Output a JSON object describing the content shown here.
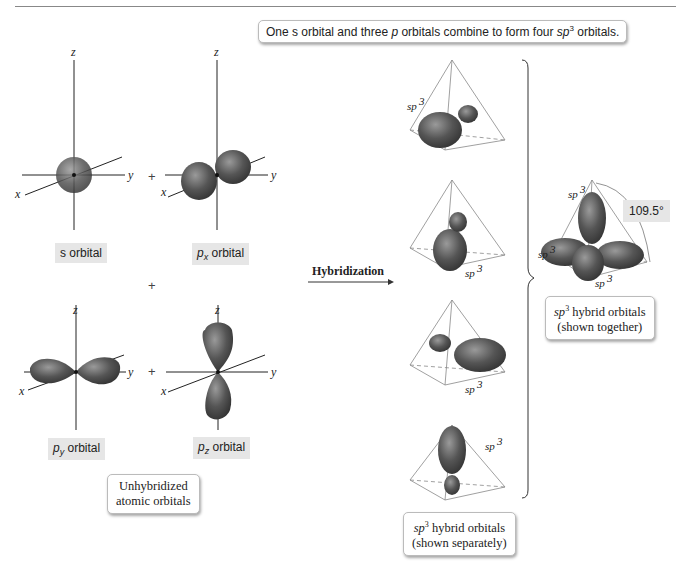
{
  "header": {
    "caption_prefix": "One s orbital and three ",
    "caption_p": "p",
    "caption_mid": " orbitals combine to form four ",
    "caption_sp": "sp",
    "caption_sup": "3",
    "caption_suffix": " orbitals."
  },
  "axes": {
    "x": "x",
    "y": "y",
    "z": "z"
  },
  "operators": {
    "plus": "+"
  },
  "orbitals": {
    "s": {
      "label": "s orbital"
    },
    "px": {
      "p": "p",
      "sub": "x",
      "label": " orbital"
    },
    "py": {
      "p": "p",
      "sub": "y",
      "label": " orbital"
    },
    "pz": {
      "p": "p",
      "sub": "z",
      "label": " orbital"
    }
  },
  "unhybridized_box": {
    "line1": "Unhybridized",
    "line2": "atomic orbitals"
  },
  "arrow": {
    "label": "Hybridization"
  },
  "sp3_label": "sp3",
  "separate_box": {
    "sp": "sp",
    "sup": "3",
    "line1_rest": " hybrid orbitals",
    "line2": "(shown separately)"
  },
  "together_box": {
    "sp": "sp",
    "sup": "3",
    "line1_rest": " hybrid orbitals",
    "line2": "(shown together)"
  },
  "angle": {
    "value": "109.5°"
  },
  "colors": {
    "orbital": "#4a4a4a",
    "orbital_highlight": "#8a8a8a",
    "label_bg": "#e6e6e6",
    "tetrahedron": "#888888"
  }
}
